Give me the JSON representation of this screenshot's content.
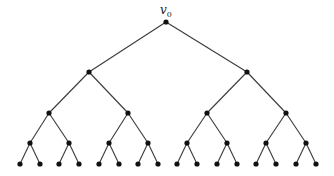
{
  "diagram": {
    "type": "complete-binary-tree",
    "depth": 4,
    "root_label": "v",
    "root_label_subscript": "0",
    "colors": {
      "edge": "#3a3a3a",
      "node": "#111111",
      "background": "#ffffff"
    },
    "node_radius": 2.6,
    "levels": [
      {
        "y": 22,
        "x": [
          166
        ]
      },
      {
        "y": 72,
        "x": [
          89,
          247
        ]
      },
      {
        "y": 113,
        "x": [
          49,
          128,
          207,
          286
        ]
      },
      {
        "y": 143,
        "x": [
          30,
          69,
          109,
          148,
          187,
          227,
          266,
          306
        ]
      },
      {
        "y": 164,
        "x": [
          20,
          40,
          59,
          79,
          99,
          119,
          138,
          158,
          177,
          197,
          217,
          237,
          256,
          276,
          296,
          316
        ]
      }
    ]
  }
}
